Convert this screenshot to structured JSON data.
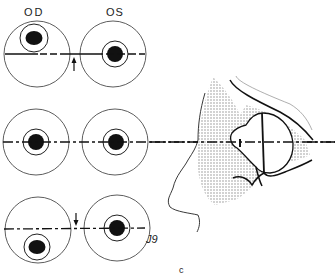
{
  "figure": {
    "labels": {
      "right_eye": "OD",
      "left_eye": "OS",
      "signature": "J9",
      "caption": "c"
    },
    "rows": [
      {
        "name": "row-1",
        "description": "OD pupil displaced upward, arrow pointing up",
        "arrow": "up"
      },
      {
        "name": "row-2",
        "description": "Both pupils centered on horizontal axis",
        "arrow": "none"
      },
      {
        "name": "row-3",
        "description": "OD pupil displaced downward, arrow pointing down",
        "arrow": "down"
      }
    ],
    "side_view": {
      "description": "Profile of face with eye globe cross-section on horizontal dashed axis"
    },
    "colors": {
      "line": "#1a1a1a",
      "stipple": "#bdbdbd",
      "background": "#ffffff"
    }
  }
}
